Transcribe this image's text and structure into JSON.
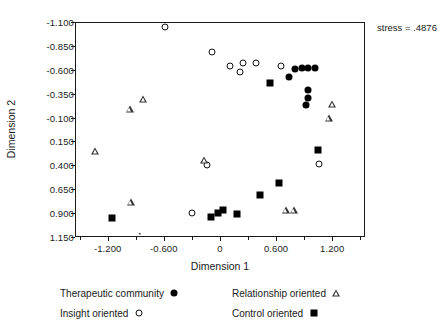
{
  "chart_data": {
    "type": "scatter",
    "title": "",
    "xlabel": "Dimension 1",
    "ylabel": "Dimension 2",
    "xlim": [
      -1.55,
      1.55
    ],
    "ylim": [
      -1.1,
      1.15
    ],
    "xticks": [
      -1.2,
      -0.6,
      0,
      0.6,
      1.2
    ],
    "xticklabels": [
      "-1.200",
      "-0.600",
      "0",
      "0.600",
      "1.200"
    ],
    "yticks": [
      1.15,
      0.9,
      0.65,
      0.4,
      0.15,
      -0.1,
      -0.35,
      -0.6,
      -0.85,
      -1.1
    ],
    "yticklabels": [
      "1.150",
      "0.900",
      "0.650",
      "0.400",
      "0.150",
      "-0.100",
      "-0.350",
      "-0.600",
      "-0.850",
      "-1.100"
    ],
    "grid": false,
    "legend_position": "below",
    "annotations": [
      {
        "name": "stress-annotation",
        "text": "stress = .4876"
      }
    ],
    "series": [
      {
        "name": "Therapeutic community",
        "marker": "filled-circle",
        "color": "#000000",
        "points": [
          [
            0.905,
            -0.245
          ],
          [
            0.925,
            -0.32
          ],
          [
            0.93,
            -0.4
          ],
          [
            0.725,
            -0.54
          ],
          [
            0.79,
            -0.615
          ],
          [
            0.865,
            -0.625
          ],
          [
            0.935,
            -0.625
          ],
          [
            1.0,
            -0.625
          ]
        ]
      },
      {
        "name": "Insight oriented",
        "marker": "open-circle",
        "color": "#111111",
        "points": [
          [
            -0.31,
            0.89
          ],
          [
            -0.145,
            0.385
          ],
          [
            1.05,
            0.375
          ],
          [
            -0.095,
            -0.8
          ],
          [
            0.095,
            -0.65
          ],
          [
            0.205,
            -0.59
          ],
          [
            0.23,
            -0.68
          ],
          [
            0.37,
            -0.68
          ],
          [
            0.64,
            -0.65
          ],
          [
            -0.6,
            -1.055
          ]
        ]
      },
      {
        "name": "Relationship oriented",
        "marker": "open-triangle",
        "color": "#333333",
        "points": [
          [
            -0.965,
            0.775
          ],
          [
            -1.345,
            0.235
          ],
          [
            -0.18,
            0.335
          ],
          [
            -0.975,
            -0.205
          ],
          [
            -0.83,
            -0.305
          ],
          [
            0.69,
            0.855
          ],
          [
            0.775,
            0.855
          ],
          [
            1.15,
            -0.105
          ],
          [
            1.19,
            -0.255
          ]
        ]
      },
      {
        "name": "Control oriented",
        "marker": "filled-square",
        "color": "#000000",
        "points": [
          [
            -1.165,
            0.94
          ],
          [
            -0.105,
            0.925
          ],
          [
            -0.035,
            0.885
          ],
          [
            0.02,
            0.855
          ],
          [
            0.175,
            0.895
          ],
          [
            0.42,
            0.7
          ],
          [
            0.62,
            0.57
          ],
          [
            1.04,
            0.23
          ],
          [
            0.52,
            -0.47
          ]
        ]
      },
      {
        "name": "stray-mark",
        "marker": "dot-tiny",
        "color": "#555555",
        "points": [
          [
            -0.87,
            1.105
          ]
        ]
      }
    ]
  },
  "legend": {
    "entries": [
      {
        "label": "Therapeutic community",
        "marker": "filled-circle"
      },
      {
        "label": "Relationship oriented",
        "marker": "open-triangle"
      },
      {
        "label": "Insight oriented",
        "marker": "open-circle"
      },
      {
        "label": "Control oriented",
        "marker": "filled-square"
      }
    ]
  }
}
